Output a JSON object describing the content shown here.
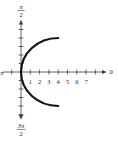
{
  "figure": {
    "background": "#ffffff",
    "axis_color": "#3c3c3c",
    "curve_color": "#141414",
    "label_color": "#242424"
  },
  "chart_data": {
    "type": "line",
    "coordinate_system": "polar",
    "title": "",
    "angle_labels": {
      "right": "0",
      "left": "π",
      "top_numerator": "π",
      "top_denominator": "2",
      "bottom_numerator": "3π",
      "bottom_denominator": "2"
    },
    "radial_ticks": [
      1,
      2,
      3,
      4,
      5,
      6,
      7
    ],
    "radial_tick_labels": [
      "1",
      "2",
      "3",
      "4",
      "5",
      "6",
      "7"
    ],
    "unlabeled_radial_tick": 8,
    "left_unlabeled_tick": -1,
    "vertical_ticks_per_side": 5,
    "axis_range": [
      0,
      8
    ],
    "curve": {
      "shape": "semicircular-arc",
      "description": "left half of circle centered at (4,0) with radius 4, passing through the pole; arc runs from (4,4) through (0,0) to (4,-4)",
      "center": [
        4,
        0
      ],
      "radius": 4,
      "start_point": [
        4,
        4
      ],
      "end_point": [
        4,
        -4
      ]
    }
  }
}
